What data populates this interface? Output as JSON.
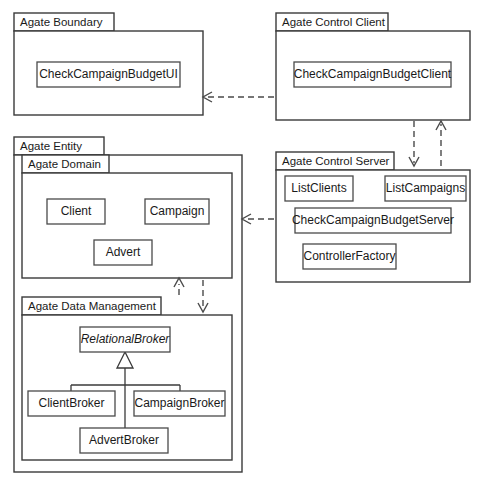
{
  "diagram": {
    "kind": "uml-package-diagram",
    "width": 483,
    "height": 482,
    "background_color": "#ffffff",
    "line_color": "#3a3a3a",
    "text_color": "#1a1a1a"
  },
  "packages": {
    "boundary": {
      "label": "Agate Boundary",
      "classes": [
        {
          "name": "CheckCampaignBudgetUI",
          "abstract": false
        }
      ]
    },
    "control_client": {
      "label": "Agate Control Client",
      "classes": [
        {
          "name": "CheckCampaignBudgetClient",
          "abstract": false
        }
      ]
    },
    "entity": {
      "label": "Agate Entity",
      "classes": []
    },
    "domain": {
      "label": "Agate Domain",
      "classes": [
        {
          "name": "Client",
          "abstract": false
        },
        {
          "name": "Campaign",
          "abstract": false
        },
        {
          "name": "Advert",
          "abstract": false
        }
      ]
    },
    "control_server": {
      "label": "Agate Control Server",
      "classes": [
        {
          "name": "ListClients",
          "abstract": false
        },
        {
          "name": "ListCampaigns",
          "abstract": false
        },
        {
          "name": "CheckCampaignBudgetServer",
          "abstract": false
        },
        {
          "name": "ControllerFactory",
          "abstract": false
        }
      ]
    },
    "data_management": {
      "label": "Agate Data Management",
      "classes": [
        {
          "name": "RelationalBroker",
          "abstract": true
        },
        {
          "name": "ClientBroker",
          "abstract": false
        },
        {
          "name": "CampaignBroker",
          "abstract": false
        },
        {
          "name": "AdvertBroker",
          "abstract": false
        }
      ]
    }
  },
  "relationships": {
    "dependencies": [
      {
        "from": "Agate Control Client",
        "to": "Agate Boundary",
        "style": "dashed-arrow",
        "direction": "left"
      },
      {
        "from": "Agate Control Client",
        "to": "Agate Control Server",
        "style": "dashed-arrow",
        "direction": "down"
      },
      {
        "from": "Agate Control Server",
        "to": "Agate Control Client",
        "style": "dashed-arrow",
        "direction": "up"
      },
      {
        "from": "Agate Control Server",
        "to": "Agate Entity",
        "style": "dashed-arrow",
        "direction": "left"
      },
      {
        "from": "Agate Data Management",
        "to": "Agate Domain",
        "style": "dashed-arrow",
        "direction": "up"
      },
      {
        "from": "Agate Domain",
        "to": "Agate Data Management",
        "style": "dashed-arrow",
        "direction": "down"
      }
    ],
    "generalizations": [
      {
        "parent": "RelationalBroker",
        "child": "ClientBroker",
        "style": "hollow-triangle"
      },
      {
        "parent": "RelationalBroker",
        "child": "CampaignBroker",
        "style": "hollow-triangle"
      },
      {
        "parent": "RelationalBroker",
        "child": "AdvertBroker",
        "style": "hollow-triangle"
      }
    ]
  }
}
